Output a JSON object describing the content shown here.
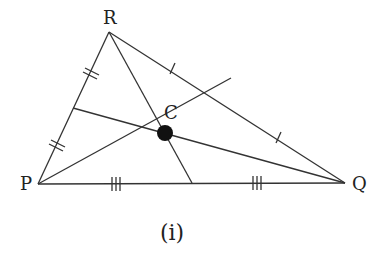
{
  "diagram": {
    "caption": "(i)",
    "vertices": {
      "P": {
        "label": "P",
        "x": 38,
        "y": 184
      },
      "Q": {
        "label": "Q",
        "x": 345,
        "y": 183
      },
      "R": {
        "label": "R",
        "x": 109,
        "y": 32
      }
    },
    "centroid": {
      "label": "C",
      "x": 165,
      "y": 133
    },
    "midpoints": {
      "PR": {
        "x": 73,
        "y": 108
      },
      "RQ": {
        "x": 231,
        "y": 78
      },
      "PQ": {
        "x": 192,
        "y": 183
      }
    },
    "tick_marks": {
      "PR": "double",
      "RQ": "single",
      "PQ": "triple"
    },
    "stroke_color": "#333333",
    "point_color": "#111111"
  }
}
